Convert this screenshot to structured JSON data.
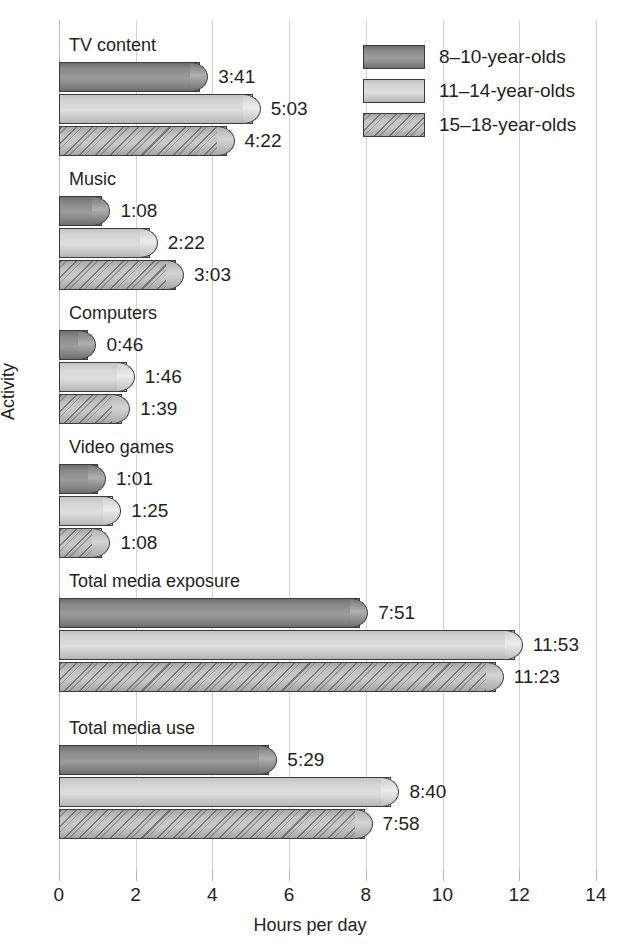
{
  "chart_data": {
    "type": "bar",
    "orientation": "horizontal",
    "title": "",
    "xlabel": "Hours per day",
    "ylabel": "Activity",
    "xlim": [
      0,
      14
    ],
    "xticks": [
      "0",
      "2",
      "4",
      "6",
      "8",
      "10",
      "12",
      "14"
    ],
    "grid": true,
    "legend_position": "top-right",
    "categories": [
      "TV content",
      "Music",
      "Computers",
      "Video games",
      "Total media exposure",
      "Total media use"
    ],
    "series": [
      {
        "name": "8–10-year-olds",
        "values": [
          3.683,
          1.133,
          0.767,
          1.017,
          7.85,
          5.483
        ],
        "labels": [
          "3:41",
          "1:08",
          "0:46",
          "1:01",
          "7:51",
          "5:29"
        ]
      },
      {
        "name": "11–14-year-olds",
        "values": [
          5.05,
          2.367,
          1.767,
          1.417,
          11.883,
          8.667
        ],
        "labels": [
          "5:03",
          "2:22",
          "1:46",
          "1:25",
          "11:53",
          "8:40"
        ]
      },
      {
        "name": "15–18-year-olds",
        "values": [
          4.367,
          3.05,
          1.65,
          1.133,
          11.383,
          7.967
        ],
        "labels": [
          "4:22",
          "3:03",
          "1:39",
          "1:08",
          "11:23",
          "7:58"
        ]
      }
    ],
    "series_colors": [
      "#8a8a8a",
      "#d6d6d6",
      "#b3b3b3"
    ],
    "series_patterns": [
      "solid-dark-gradient",
      "solid-light-gradient",
      "diagonal-dotted-hatch"
    ]
  }
}
